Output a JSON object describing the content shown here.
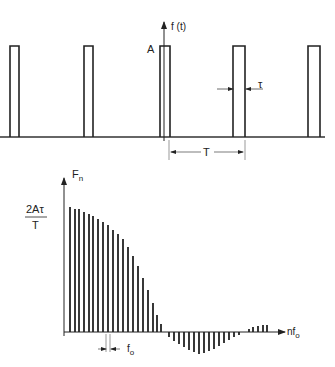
{
  "top_diagram": {
    "y_axis_label": "f (t)",
    "amplitude_label": "A",
    "pulse_width_label": "τ",
    "period_label": "T",
    "pulses": [
      {
        "x": 10,
        "w": 9
      },
      {
        "x": 84,
        "w": 9
      },
      {
        "x": 160,
        "w": 10
      },
      {
        "x": 233,
        "w": 12
      },
      {
        "x": 308,
        "w": 12
      }
    ],
    "baseline_y": 137,
    "pulse_top_y": 46
  },
  "bottom_diagram": {
    "y_axis_label": "F",
    "y_axis_subscript": "n",
    "peak_label_numerator": "2Aτ",
    "peak_label_denominator": "T",
    "x_axis_label": "nf",
    "x_axis_subscript": "o",
    "spacing_label": "f",
    "spacing_subscript": "o",
    "baseline_y": 332,
    "bars": [
      {
        "x": 70,
        "top": 207
      },
      {
        "x": 75,
        "top": 209
      },
      {
        "x": 79,
        "top": 209
      },
      {
        "x": 84,
        "top": 212
      },
      {
        "x": 89,
        "top": 214
      },
      {
        "x": 93,
        "top": 216
      },
      {
        "x": 98,
        "top": 219
      },
      {
        "x": 103,
        "top": 222
      },
      {
        "x": 108,
        "top": 225
      },
      {
        "x": 113,
        "top": 230
      },
      {
        "x": 118,
        "top": 234
      },
      {
        "x": 123,
        "top": 239
      },
      {
        "x": 128,
        "top": 247
      },
      {
        "x": 133,
        "top": 256
      },
      {
        "x": 138,
        "top": 266
      },
      {
        "x": 143,
        "top": 278
      },
      {
        "x": 148,
        "top": 290
      },
      {
        "x": 153,
        "top": 303
      },
      {
        "x": 157,
        "top": 315
      },
      {
        "x": 161,
        "top": 324
      },
      {
        "x": 169,
        "top": 337
      },
      {
        "x": 174,
        "top": 341
      },
      {
        "x": 179,
        "top": 344
      },
      {
        "x": 184,
        "top": 347
      },
      {
        "x": 189,
        "top": 350
      },
      {
        "x": 194,
        "top": 352
      },
      {
        "x": 199,
        "top": 354
      },
      {
        "x": 204,
        "top": 353
      },
      {
        "x": 209,
        "top": 351
      },
      {
        "x": 214,
        "top": 349
      },
      {
        "x": 219,
        "top": 346
      },
      {
        "x": 224,
        "top": 343
      },
      {
        "x": 229,
        "top": 340
      },
      {
        "x": 234,
        "top": 337
      },
      {
        "x": 239,
        "top": 335
      },
      {
        "x": 249,
        "top": 329
      },
      {
        "x": 253,
        "top": 327
      },
      {
        "x": 258,
        "top": 326
      },
      {
        "x": 263,
        "top": 325
      },
      {
        "x": 267,
        "top": 325
      }
    ]
  }
}
